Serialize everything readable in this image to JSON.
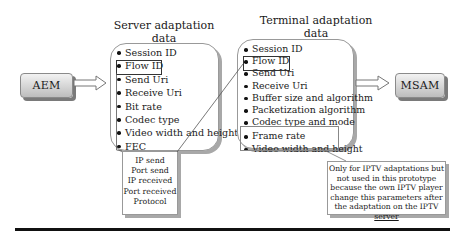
{
  "nodes": {
    "aem": {
      "label": "AEM"
    },
    "msam": {
      "label": "MSAM"
    }
  },
  "server_panel": {
    "title_line1": "Server adaptation",
    "title_line2": "data",
    "items": [
      "Session ID",
      "Flow ID",
      "Send Uri",
      "Receive Uri",
      "Bit rate",
      "Codec type",
      "Video width and height",
      "FEC"
    ],
    "highlighted_item": "Flow ID"
  },
  "terminal_panel": {
    "title_line1": "Terminal adaptation",
    "title_line2": "data",
    "items": [
      "Session ID",
      "Flow ID",
      "Send Uri",
      "Receive Uri",
      "Buffer size and algorithm",
      "Packetization algorithm",
      "Codec type and mode",
      "Frame rate",
      "Video width and height"
    ],
    "highlighted_item": "Flow ID",
    "grouped_items": [
      "Frame rate",
      "Video width and height"
    ]
  },
  "flow_id_note": {
    "lines": [
      "IP send",
      "Port send",
      "IP received",
      "Port received",
      "Protocol"
    ]
  },
  "iptv_note": {
    "lines": [
      "Only for IPTV adaptations but",
      "not used in this prototype",
      "because the own IPTV player",
      "change this parameters after",
      "the adaptation on the IPTV",
      "server"
    ]
  },
  "arrows": [
    {
      "from": "AEM",
      "to": "Server adaptation data"
    },
    {
      "from": "Terminal adaptation data",
      "to": "MSAM"
    }
  ]
}
